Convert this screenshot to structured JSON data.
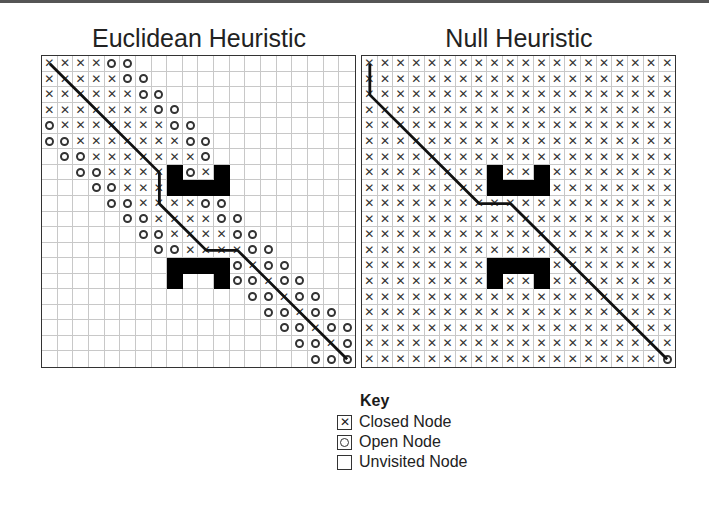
{
  "panels": [
    {
      "title": "Euclidean Heuristic",
      "grid_size": 20,
      "legend_codes": "X=closed, O=open, .=unvisited, #=obstacle, S=start(closed), G=goal(open)",
      "rows": [
        "XXXXOO..............",
        "XXXXXOO.............",
        "XXXXXXOO............",
        "XXXXXXXOO...........",
        "OXXXXXXXOO..........",
        "OOXXXXXXXOO.........",
        ".OOXXXXXXXO.........",
        "..OOXXXX#OX#........",
        "...OOXXX####........",
        "....OOXXXXOO........",
        ".....OOXXXXOO.......",
        "......OOXXXXOO......",
        ".......OOXXXXOO.....",
        "........####OXOO....",
        "........#..#OOXOO...",
        ".............OOXOO..",
        "..............OOXOO.",
        "...............OOXOO",
        "................OOXO",
        ".................OOO"
      ],
      "path": [
        [
          0,
          0
        ],
        [
          7,
          7
        ],
        [
          7,
          9
        ],
        [
          10,
          12
        ],
        [
          12,
          12
        ],
        [
          19,
          19
        ]
      ]
    },
    {
      "title": "Null Heuristic",
      "grid_size": 20,
      "rows": [
        "XXXXXXXXXXXXXXXXXXXX",
        "XXXXXXXXXXXXXXXXXXXX",
        "XXXXXXXXXXXXXXXXXXXX",
        "XXXXXXXXXXXXXXXXXXXX",
        "XXXXXXXXXXXXXXXXXXXX",
        "XXXXXXXXXXXXXXXXXXXX",
        "XXXXXXXXXXXXXXXXXXXX",
        "XXXXXXXX#XX#XXXXXXXX",
        "XXXXXXXX####XXXXXXXX",
        "XXXXXXXXXXXXXXXXXXXX",
        "XXXXXXXXXXXXXXXXXXXX",
        "XXXXXXXXXXXXXXXXXXXX",
        "XXXXXXXXXXXXXXXXXXXX",
        "XXXXXXXX####XXXXXXXX",
        "XXXXXXXX#XX#XXXXXXXX",
        "XXXXXXXXXXXXXXXXXXXX",
        "XXXXXXXXXXXXXXXXXXXX",
        "XXXXXXXXXXXXXXXXXXXX",
        "XXXXXXXXXXXXXXXXXXXX",
        "XXXXXXXXXXXXXXXXXXXO"
      ],
      "path": [
        [
          0,
          0
        ],
        [
          0,
          2
        ],
        [
          7,
          9
        ],
        [
          9,
          9
        ],
        [
          19,
          19
        ]
      ]
    }
  ],
  "key": {
    "title": "Key",
    "items": [
      {
        "symbol": "closed-icon",
        "label": "Closed Node"
      },
      {
        "symbol": "open-icon",
        "label": "Open Node"
      },
      {
        "symbol": "unvisited-icon",
        "label": "Unvisited Node"
      }
    ]
  },
  "colors": {
    "grid_line": "#c8c8c8",
    "obstacle": "#000000",
    "path": "#111111",
    "symbol": "#333333"
  }
}
